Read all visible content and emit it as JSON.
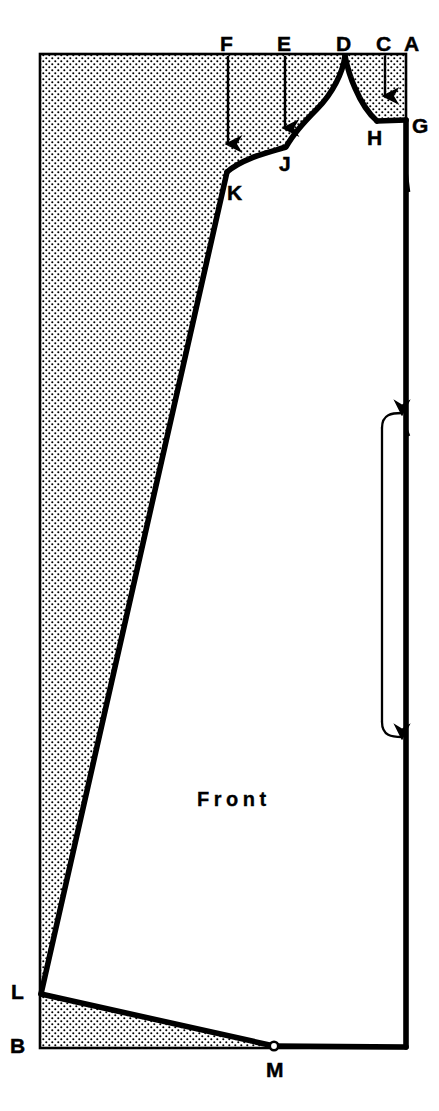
{
  "diagram": {
    "title_text": "Front",
    "piece_name": "Front",
    "type": "sewing-pattern-draft",
    "colors": {
      "ink": "#000000",
      "paper": "#ffffff",
      "stipple": "#000000"
    },
    "canvas": {
      "width": 439,
      "height": 1111
    },
    "draft_box": {
      "name": "stippled-draft-rectangle",
      "left": 40,
      "top": 54,
      "right": 406,
      "bottom": 1048
    },
    "points": [
      {
        "id": "A",
        "label": "A",
        "label_x": 404,
        "label_y": 33,
        "x": 406,
        "y": 54,
        "note": "top-right corner of draft box"
      },
      {
        "id": "B",
        "label": "B",
        "label_x": 10,
        "label_y": 1035,
        "x": 40,
        "y": 1048,
        "note": "bottom-left corner of draft box"
      },
      {
        "id": "C",
        "label": "C",
        "label_x": 376,
        "label_y": 33,
        "x": 385,
        "y": 54,
        "note": "top reference, arrow drops to shoulder"
      },
      {
        "id": "D",
        "label": "D",
        "label_x": 337,
        "label_y": 33,
        "x": 345,
        "y": 56,
        "note": "neck / centre peak apex on top line"
      },
      {
        "id": "E",
        "label": "E",
        "label_x": 277,
        "label_y": 33,
        "x": 285,
        "y": 54,
        "note": "top reference, arrow drops to curve at J"
      },
      {
        "id": "F",
        "label": "F",
        "label_x": 220,
        "label_y": 33,
        "x": 228,
        "y": 54,
        "note": "top reference, arrow drops to curve at K"
      },
      {
        "id": "G",
        "label": "G",
        "label_x": 414,
        "label_y": 120,
        "x": 406,
        "y": 120,
        "note": "shoulder point on right edge"
      },
      {
        "id": "H",
        "label": "H",
        "label_x": 368,
        "label_y": 133,
        "x": 377,
        "y": 121,
        "note": "end of armhole curve, start of shoulder line"
      },
      {
        "id": "J",
        "label": "J",
        "label_x": 278,
        "label_y": 159,
        "x": 285,
        "y": 147,
        "note": "curve control point"
      },
      {
        "id": "K",
        "label": "K",
        "label_x": 228,
        "label_y": 190,
        "x": 226,
        "y": 172,
        "note": "corner where side seam meets top curve"
      },
      {
        "id": "L",
        "label": "L",
        "label_x": 12,
        "label_y": 985,
        "x": 40,
        "y": 995,
        "note": "left side point, start of hem line"
      },
      {
        "id": "M",
        "label": "M",
        "label_x": 267,
        "label_y": 1070,
        "x": 274,
        "y": 1047,
        "note": "hem point dot on bottom line"
      }
    ],
    "arrows": [
      {
        "name": "arrow-from-F",
        "from_label": "F",
        "x": 228,
        "y_start": 56,
        "y_end": 150
      },
      {
        "name": "arrow-from-E",
        "from_label": "E",
        "x": 285,
        "y_start": 56,
        "y_end": 134
      },
      {
        "name": "arrow-from-C",
        "from_label": "C",
        "x": 385,
        "y_start": 56,
        "y_end": 102
      }
    ],
    "grainline": {
      "name": "grainline-fold-bracket",
      "x_bracket": 382,
      "x_tip": 404,
      "y_top": 414,
      "y_bottom": 736,
      "arrow_count": 2,
      "direction": "both-ends-point-right-to-fold-edge"
    },
    "front_text_pos": {
      "x": 197,
      "y": 789
    }
  }
}
